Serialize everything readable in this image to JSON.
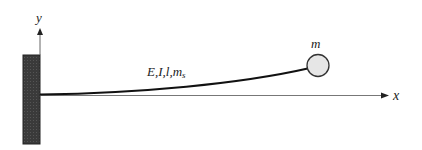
{
  "diagram": {
    "axes": {
      "x_label": "x",
      "y_label": "y"
    },
    "beam_label": {
      "main": "E,I,l,m",
      "subscript": "s"
    },
    "mass_label": "m",
    "colors": {
      "wall": "#3a3a3a",
      "beam": "#111111",
      "axis": "#666666",
      "mass_fill": "#e6e6e6",
      "mass_stroke": "#333333"
    }
  }
}
